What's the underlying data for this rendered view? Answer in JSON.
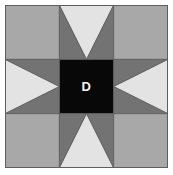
{
  "block": {
    "title": "Sawtooth Star quilt block",
    "center_label": "D",
    "grid": {
      "rows": 3,
      "cols": 3,
      "unit_size": 54.333
    },
    "colors": {
      "corner_fabric": "#a8a8a8",
      "star_point_fabric": "#737373",
      "background_fabric": "#e3e3e3",
      "center_fabric": "#080808",
      "seam_line": "#5e5e5e",
      "label_text": "#f2f2f2",
      "page_background": "#ffffff"
    },
    "units": [
      {
        "name": "corner-top-left",
        "row": 0,
        "col": 0,
        "type": "plain-square",
        "fabric": "corner_fabric"
      },
      {
        "name": "flying-geese-top",
        "row": 0,
        "col": 1,
        "type": "flying-geese",
        "point_direction": "up"
      },
      {
        "name": "corner-top-right",
        "row": 0,
        "col": 2,
        "type": "plain-square",
        "fabric": "corner_fabric"
      },
      {
        "name": "flying-geese-left",
        "row": 1,
        "col": 0,
        "type": "flying-geese",
        "point_direction": "left"
      },
      {
        "name": "center-square",
        "row": 1,
        "col": 1,
        "type": "plain-square",
        "fabric": "center_fabric",
        "label": "D"
      },
      {
        "name": "flying-geese-right",
        "row": 1,
        "col": 2,
        "type": "flying-geese",
        "point_direction": "right"
      },
      {
        "name": "corner-bottom-left",
        "row": 2,
        "col": 0,
        "type": "plain-square",
        "fabric": "corner_fabric"
      },
      {
        "name": "flying-geese-bottom",
        "row": 2,
        "col": 1,
        "type": "flying-geese",
        "point_direction": "down"
      },
      {
        "name": "corner-bottom-right",
        "row": 2,
        "col": 2,
        "type": "plain-square",
        "fabric": "corner_fabric"
      }
    ]
  }
}
